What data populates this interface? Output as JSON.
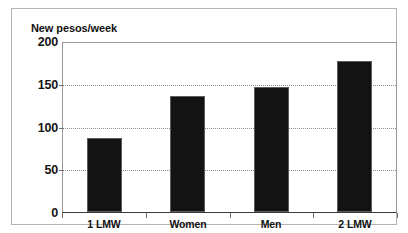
{
  "chart_data": {
    "type": "bar",
    "title": "New pesos/week",
    "xlabel": "",
    "ylabel": "New pesos/week",
    "categories": [
      "1 LMW",
      "Women",
      "Men",
      "2 LMW"
    ],
    "values": [
      88,
      137,
      148,
      179
    ],
    "ylim": [
      0,
      200
    ],
    "yticks": [
      0,
      50,
      100,
      150,
      200
    ],
    "ytick_labels": [
      "0",
      "50",
      "100",
      "150",
      "200"
    ],
    "grid": true,
    "grid_axis": "y",
    "grid_style": "dotted",
    "legend": false,
    "legend_position": "none",
    "bar_color": "#131313",
    "bar_edge_color": "#5d5d5d",
    "grid_color": "#8f8f8f",
    "axis_color": "#3a3a3a",
    "frame_color": "#b4b4b4",
    "background_color": "#ffffff",
    "text_color": "#111111"
  }
}
